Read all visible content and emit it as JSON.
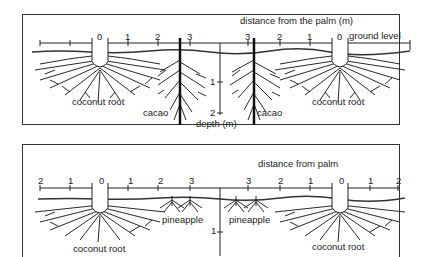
{
  "top_panel": {
    "axis_title": "distance from the palm (m)",
    "ground_label": "ground level",
    "left_ticks": [
      "0",
      "1",
      "2",
      "3"
    ],
    "right_ticks": [
      "3",
      "2",
      "1",
      "0"
    ],
    "depth_ticks": [
      "1",
      "2"
    ],
    "depth_label": "depth (m)",
    "labels": {
      "coconut_left": "coconut root",
      "cacao_left": "cacao",
      "cacao_right": "cacao",
      "coconut_right": "coconut root"
    }
  },
  "bottom_panel": {
    "axis_title": "distance from palm",
    "left_ticks": [
      "2",
      "1",
      "0",
      "1",
      "2",
      "3"
    ],
    "right_ticks": [
      "3",
      "2",
      "1",
      "0",
      "1",
      "2"
    ],
    "depth_ticks": [
      "1"
    ],
    "labels": {
      "coconut_left": "coconut root",
      "pineapple_left": "pineapple",
      "pineapple_right": "pineapple",
      "coconut_right": "coconut root"
    }
  }
}
